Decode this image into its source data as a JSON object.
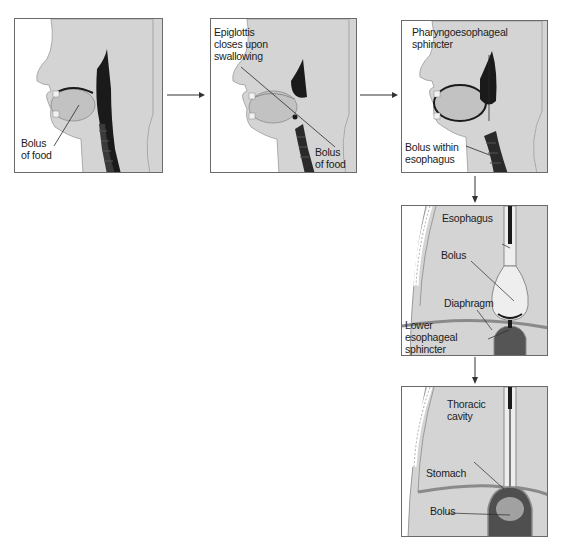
{
  "figure": {
    "colors": {
      "tissue": "#d4d4d4",
      "tissue_dark": "#b8b8b8",
      "cavity": "#1a1a1a",
      "border": "#6a6a6a",
      "background": "#ffffff"
    }
  },
  "panels": [
    {
      "id": "panel-1",
      "stage": "oral",
      "labels": [
        {
          "text": "Bolus\nof food"
        }
      ]
    },
    {
      "id": "panel-2",
      "stage": "pharyngeal-epiglottis",
      "labels": [
        {
          "text": "Epiglottis\ncloses upon\nswallowing"
        },
        {
          "text": "Bolus\nof food"
        }
      ]
    },
    {
      "id": "panel-3",
      "stage": "pharyngeal-sphincter",
      "labels": [
        {
          "text": "Pharyngoesophageal\nsphincter"
        },
        {
          "text": "Bolus within\nesophagus"
        }
      ]
    },
    {
      "id": "panel-4",
      "stage": "esophageal",
      "labels": [
        {
          "text": "Esophagus"
        },
        {
          "text": "Bolus"
        },
        {
          "text": "Diaphragm"
        },
        {
          "text": "Lower\nesophageal\nsphincter"
        }
      ]
    },
    {
      "id": "panel-5",
      "stage": "gastric-entry",
      "labels": [
        {
          "text": "Thoracic\ncavity"
        },
        {
          "text": "Stomach"
        },
        {
          "text": "Bolus"
        }
      ]
    }
  ],
  "arrows": [
    {
      "from": "panel-1",
      "to": "panel-2",
      "direction": "right"
    },
    {
      "from": "panel-2",
      "to": "panel-3",
      "direction": "right"
    },
    {
      "from": "panel-3",
      "to": "panel-4",
      "direction": "down"
    },
    {
      "from": "panel-4",
      "to": "panel-5",
      "direction": "down"
    }
  ]
}
